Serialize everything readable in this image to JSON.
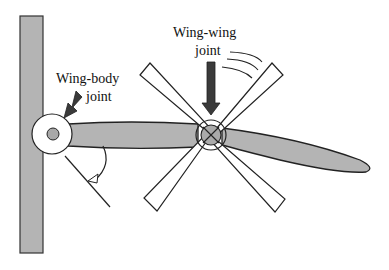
{
  "diagram": {
    "title": "",
    "labels": {
      "wing_body_line1": "Wing-body",
      "wing_body_line2": "joint",
      "wing_wing_line1": "Wing-wing",
      "wing_wing_line2": "joint"
    },
    "components": [
      {
        "id": "body",
        "shape": "vertical-bar",
        "fill": "#b4b4b4"
      },
      {
        "id": "wing-body-joint",
        "shape": "circle-with-hub"
      },
      {
        "id": "inner-wing",
        "shape": "elongated-panel",
        "fill": "#b4b4b4"
      },
      {
        "id": "wing-wing-joint",
        "shape": "circle-with-hub",
        "hub_fill": "#aaaaaa"
      },
      {
        "id": "outer-wing",
        "shape": "tapered-ellipse",
        "fill": "#b4b4b4"
      },
      {
        "id": "rotation-blades",
        "shape": "four-tapered-blades",
        "fill": "#ffffff"
      },
      {
        "id": "angle-indicator",
        "shape": "line-with-arc-arrow"
      },
      {
        "id": "motion-lines",
        "shape": "three-curved-strokes"
      }
    ],
    "colors": {
      "fill_gray": "#b4b4b4",
      "stroke": "#222222",
      "arrow_fill": "#3a3a3a",
      "background": "#ffffff"
    }
  }
}
